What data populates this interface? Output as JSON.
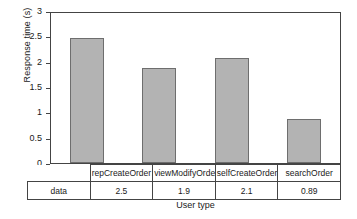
{
  "chart_data": {
    "type": "bar",
    "title": "",
    "xlabel": "User type",
    "ylabel": "Response time (s)",
    "categories": [
      "repCreateOrder",
      "viewModifyOrder",
      "selfCreateOrder",
      "searchOrder"
    ],
    "series": [
      {
        "name": "data",
        "values": [
          2.5,
          1.9,
          2.1,
          0.89
        ]
      }
    ],
    "value_labels": [
      "2.5",
      "1.9",
      "2.1",
      "0.89"
    ],
    "ylim": [
      0,
      3
    ],
    "yticks": [
      0,
      0.5,
      1,
      1.5,
      2,
      2.5,
      3
    ],
    "ytick_labels": [
      "0",
      "0.5",
      "1",
      "1.5",
      "2",
      "2.5",
      "3"
    ],
    "grid": false,
    "legend": "none",
    "bar_color": "#b3b3b3",
    "bar_edge_color": "#6e6e6e",
    "frame_color": "#444444",
    "data_table": {
      "row_label": "data",
      "header_row": [
        "repCreateOrder",
        "viewModifyOrder",
        "selfCreateOrder",
        "searchOrder"
      ],
      "value_row": [
        "2.5",
        "1.9",
        "2.1",
        "0.89"
      ]
    }
  }
}
